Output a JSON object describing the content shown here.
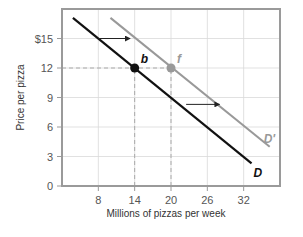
{
  "chart_data": {
    "type": "line",
    "title": "",
    "xlabel": "Millions of pizzas per week",
    "ylabel": "Price per pizza",
    "xlim": [
      2,
      38
    ],
    "ylim": [
      0,
      18
    ],
    "x_ticks": [
      8,
      14,
      20,
      26,
      32
    ],
    "x_tick_labels": [
      "8",
      "14",
      "20",
      "26",
      "32"
    ],
    "y_ticks": [
      0,
      3,
      6,
      9,
      12,
      15
    ],
    "y_tick_labels": [
      "0",
      "3",
      "6",
      "9",
      "12",
      "$15"
    ],
    "grid": true,
    "legend": "none (lines labeled directly)",
    "series": [
      {
        "name": "D",
        "label": "D",
        "color": "#111111",
        "points": [
          [
            3.8,
            17.1
          ],
          [
            33.3,
            2.3
          ]
        ]
      },
      {
        "name": "D'",
        "label": "D'",
        "color": "#999999",
        "points": [
          [
            10,
            17.1
          ],
          [
            36.3,
            4.0
          ]
        ]
      }
    ],
    "annotations": [
      {
        "id": "b",
        "label": "b",
        "x": 14,
        "y": 12,
        "color": "#111111",
        "on": "D"
      },
      {
        "id": "f",
        "label": "f",
        "x": 20,
        "y": 12,
        "color": "#999999",
        "on": "D'"
      }
    ],
    "reference_lines": [
      {
        "type": "horizontal",
        "y": 12,
        "x_from": 2,
        "x_to": 20,
        "style": "dashed"
      },
      {
        "type": "vertical",
        "x": 14,
        "y_from": 0,
        "y_to": 12,
        "style": "dashed"
      },
      {
        "type": "vertical",
        "x": 20,
        "y_from": 0,
        "y_to": 12,
        "style": "dashed"
      }
    ],
    "arrows": [
      {
        "from": [
          8,
          15
        ],
        "to": [
          13.2,
          15
        ],
        "meaning": "demand shift right"
      },
      {
        "from": [
          22.5,
          8.3
        ],
        "to": [
          28,
          8.3
        ],
        "meaning": "demand shift right"
      }
    ]
  },
  "colors": {
    "frame": "#9a9a9a",
    "grid": "#d9d9d9",
    "dashed": "#aaaaaa",
    "demand": "#111111",
    "demand_shifted": "#999999"
  }
}
